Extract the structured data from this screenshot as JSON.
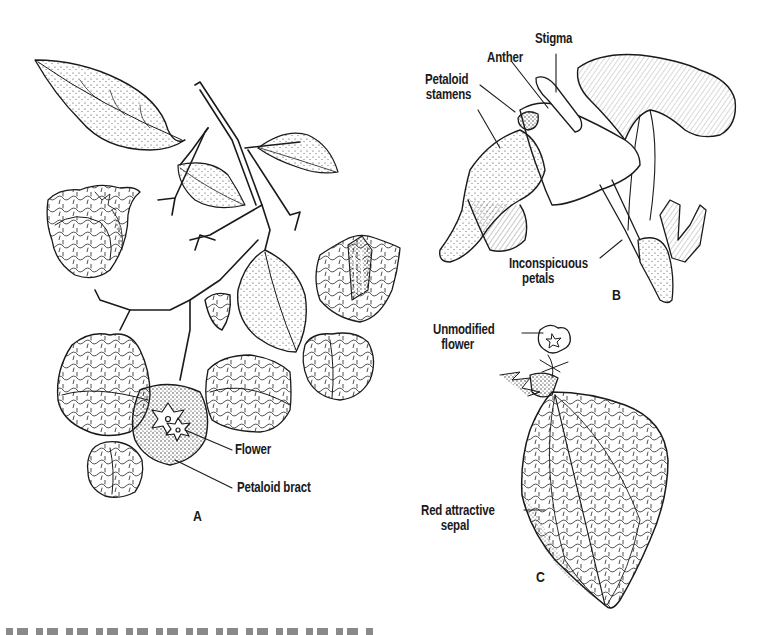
{
  "figure": {
    "panels": [
      {
        "id": "A",
        "letter": "A",
        "labels": [
          {
            "text": "Flower"
          },
          {
            "text": "Petaloid bract"
          }
        ]
      },
      {
        "id": "B",
        "letter": "B",
        "labels": [
          {
            "text": "Stigma"
          },
          {
            "text": "Anther"
          },
          {
            "text": "Petaloid",
            "line2": "stamens"
          },
          {
            "text": "Inconspicuous",
            "line2": "petals"
          }
        ]
      },
      {
        "id": "C",
        "letter": "C",
        "labels": [
          {
            "text": "Unmodified",
            "line2": "flower"
          },
          {
            "text": "Red attractive",
            "line2": "sepal"
          }
        ]
      }
    ],
    "caption": {
      "visible": "clipped",
      "text": ""
    },
    "colors": {
      "ink": "#1a1a1a",
      "paper": "#ffffff"
    }
  }
}
